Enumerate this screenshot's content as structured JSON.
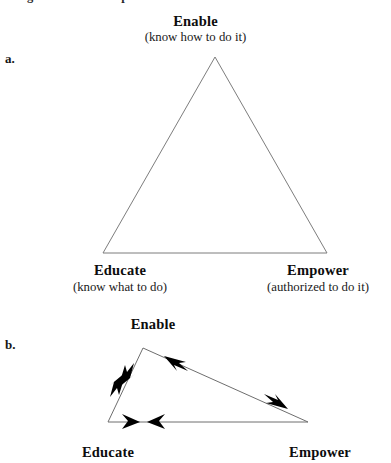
{
  "figure": {
    "running_header": "triangle of enabled empowerment",
    "background_color": "#ffffff",
    "line_color": "#7d7d7d",
    "arrow_color": "#000000"
  },
  "part_a": {
    "label": "a.",
    "top": {
      "title": "Enable",
      "subtitle": "(know how to do it)"
    },
    "bottom_left": {
      "title": "Educate",
      "subtitle": "(know what to do)"
    },
    "bottom_right": {
      "title": "Empower",
      "subtitle": "(authorized to do it)"
    }
  },
  "part_b": {
    "label": "b.",
    "top": {
      "title": "Enable"
    },
    "bottom_left": {
      "title": "Educate"
    },
    "bottom_right": {
      "title": "Empower"
    }
  }
}
